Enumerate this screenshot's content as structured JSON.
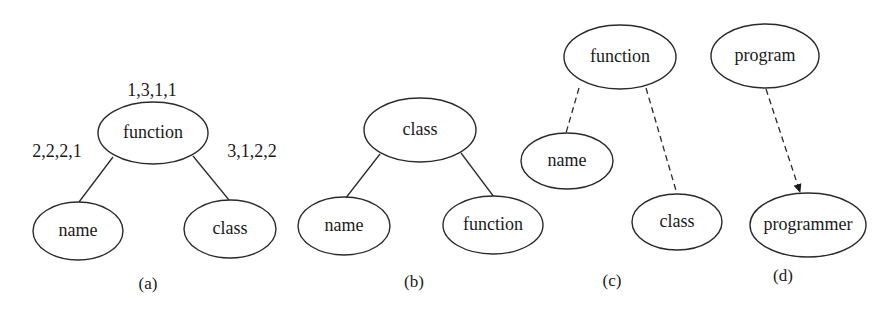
{
  "diagrams": [
    {
      "caption": "(a)",
      "nodes": [
        {
          "label": "function",
          "annotation": "1,3,1,1"
        },
        {
          "label": "name",
          "annotation": "2,2,2,1"
        },
        {
          "label": "class",
          "annotation": "3,1,2,2"
        }
      ],
      "edges": [
        {
          "from": "function",
          "to": "name",
          "style": "solid"
        },
        {
          "from": "function",
          "to": "class",
          "style": "solid"
        }
      ]
    },
    {
      "caption": "(b)",
      "nodes": [
        {
          "label": "class"
        },
        {
          "label": "name"
        },
        {
          "label": "function"
        }
      ],
      "edges": [
        {
          "from": "class",
          "to": "name",
          "style": "solid"
        },
        {
          "from": "class",
          "to": "function",
          "style": "solid"
        }
      ]
    },
    {
      "caption": "(c)",
      "nodes": [
        {
          "label": "function"
        },
        {
          "label": "name"
        },
        {
          "label": "class"
        }
      ],
      "edges": [
        {
          "from": "function",
          "to": "name",
          "style": "dashed"
        },
        {
          "from": "function",
          "to": "class",
          "style": "dashed"
        }
      ]
    },
    {
      "caption": "(d)",
      "nodes": [
        {
          "label": "program"
        },
        {
          "label": "programmer"
        }
      ],
      "edges": [
        {
          "from": "program",
          "to": "programmer",
          "style": "dashed-arrow"
        }
      ]
    }
  ]
}
